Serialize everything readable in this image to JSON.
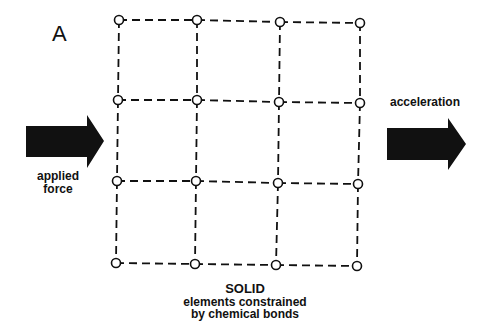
{
  "panel_label": "A",
  "labels": {
    "applied_force_line1": "applied",
    "applied_force_line2": "force",
    "acceleration": "acceleration"
  },
  "caption": {
    "title": "SOLID",
    "line1": "elements constrained",
    "line2": "by chemical bonds"
  },
  "lattice": {
    "rows": 4,
    "cols": 4,
    "nodes": [
      [
        [
          119,
          20
        ],
        [
          197,
          20
        ],
        [
          280,
          22
        ],
        [
          360,
          23
        ]
      ],
      [
        [
          118,
          100
        ],
        [
          197,
          100
        ],
        [
          279,
          102
        ],
        [
          360,
          103
        ]
      ],
      [
        [
          117,
          181
        ],
        [
          196,
          181
        ],
        [
          278,
          183
        ],
        [
          358,
          184
        ]
      ],
      [
        [
          116,
          263
        ],
        [
          195,
          264
        ],
        [
          276,
          265
        ],
        [
          357,
          266
        ]
      ]
    ],
    "bond_style": "dashed",
    "node_style": "open-circle"
  },
  "colors": {
    "ink": "#111111",
    "background": "#ffffff"
  }
}
